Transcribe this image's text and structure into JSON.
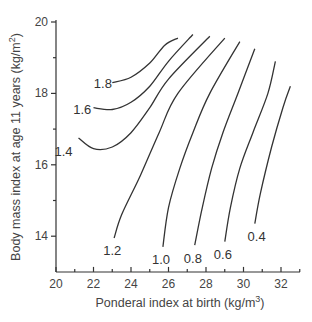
{
  "chart_data": {
    "type": "contour",
    "title": "",
    "xlabel": "Ponderal index at birth (kg/m3)",
    "ylabel": "Body mass index at age 11 years (kg/m2)",
    "xlabel_parts": {
      "main": "Ponderal index at birth (kg/m",
      "sup": "3",
      "end": ")"
    },
    "ylabel_parts": {
      "main": "Body mass index at age 11 years (kg/m",
      "sup": "2",
      "end": ")"
    },
    "xlim": [
      20,
      33
    ],
    "ylim": [
      13,
      20
    ],
    "x_ticks": [
      20,
      22,
      24,
      26,
      28,
      30,
      32
    ],
    "x_minor_ticks": [
      21,
      23,
      25,
      27,
      29,
      31,
      33
    ],
    "y_ticks": [
      14,
      16,
      18,
      20
    ],
    "y_minor_ticks": [
      15,
      17,
      19
    ],
    "grid": false,
    "legend": "none",
    "series": [
      {
        "name": "1.8",
        "label_pos": [
          22.5,
          18.3
        ],
        "points": [
          [
            23.0,
            18.3
          ],
          [
            24.0,
            18.45
          ],
          [
            25.0,
            18.85
          ],
          [
            25.8,
            19.35
          ],
          [
            26.5,
            19.55
          ]
        ]
      },
      {
        "name": "1.6",
        "label_pos": [
          21.4,
          17.55
        ],
        "points": [
          [
            22.0,
            17.6
          ],
          [
            23.0,
            17.55
          ],
          [
            24.0,
            17.75
          ],
          [
            25.0,
            18.2
          ],
          [
            26.0,
            18.9
          ],
          [
            27.3,
            19.65
          ]
        ]
      },
      {
        "name": "1.4",
        "label_pos": [
          20.4,
          16.4
        ],
        "points": [
          [
            21.2,
            16.75
          ],
          [
            22.0,
            16.45
          ],
          [
            23.0,
            16.5
          ],
          [
            24.0,
            16.9
          ],
          [
            25.0,
            17.6
          ],
          [
            26.0,
            18.4
          ],
          [
            28.2,
            19.6
          ]
        ]
      },
      {
        "name": "1.2",
        "label_pos": [
          23.0,
          13.6
        ],
        "points": [
          [
            23.1,
            13.95
          ],
          [
            23.5,
            14.6
          ],
          [
            24.5,
            15.7
          ],
          [
            25.5,
            16.9
          ],
          [
            26.5,
            18.0
          ],
          [
            29.0,
            19.55
          ]
        ]
      },
      {
        "name": "1.0",
        "label_pos": [
          25.6,
          13.35
        ],
        "points": [
          [
            25.7,
            13.7
          ],
          [
            26.0,
            14.8
          ],
          [
            26.6,
            15.9
          ],
          [
            27.3,
            16.9
          ],
          [
            28.2,
            18.0
          ],
          [
            29.8,
            19.45
          ]
        ]
      },
      {
        "name": "0.8",
        "label_pos": [
          27.3,
          13.4
        ],
        "points": [
          [
            27.4,
            13.75
          ],
          [
            27.8,
            14.8
          ],
          [
            28.3,
            15.9
          ],
          [
            28.9,
            16.9
          ],
          [
            29.7,
            18.0
          ],
          [
            30.6,
            19.25
          ]
        ]
      },
      {
        "name": "0.6",
        "label_pos": [
          28.9,
          13.5
        ],
        "points": [
          [
            29.0,
            13.85
          ],
          [
            29.3,
            14.8
          ],
          [
            29.8,
            15.9
          ],
          [
            30.5,
            16.9
          ],
          [
            31.3,
            18.0
          ],
          [
            31.7,
            18.9
          ]
        ]
      },
      {
        "name": "0.4",
        "label_pos": [
          30.7,
          14.0
        ],
        "points": [
          [
            30.6,
            14.35
          ],
          [
            30.9,
            15.2
          ],
          [
            31.5,
            16.5
          ],
          [
            32.1,
            17.6
          ],
          [
            32.5,
            18.2
          ]
        ]
      }
    ]
  }
}
